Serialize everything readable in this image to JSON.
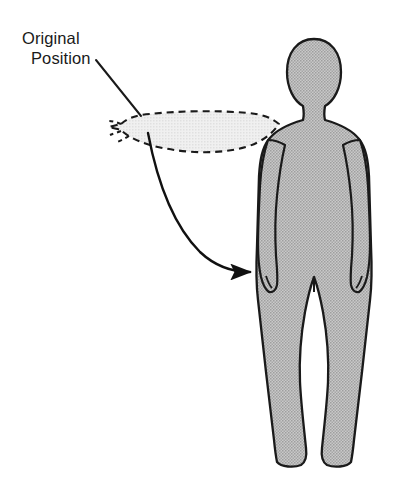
{
  "diagram": {
    "background_color": "#ffffff",
    "annotation": {
      "line1": "Original",
      "line2": "Position",
      "text_color": "#1a1a1a",
      "leader_line": {
        "from_x": 96,
        "from_y": 60,
        "to_x": 141,
        "to_y": 116
      }
    },
    "body_figure": {
      "name": "human-silhouette",
      "fill_color": "#b9b9b9",
      "outline_color": "#1a1a1a",
      "outline_width": 2.2,
      "pose": "standing, arms at sides",
      "head_center_x": 314,
      "head_center_y": 72,
      "feet_baseline_y": 466
    },
    "ghost_arm": {
      "name": "original-position-arm",
      "style": "dashed",
      "dash_pattern": "7 5",
      "stroke_color": "#1a1a1a",
      "fill_color": "#ebebeb",
      "description": "arm extended horizontally to the left at shoulder height"
    },
    "motion_arrow": {
      "name": "arm-motion-arrow",
      "stroke_color": "#111111",
      "stroke_width": 2.4,
      "direction": "downward sweeping curve to the right",
      "arrowhead_x": 255,
      "arrowhead_y": 272
    }
  }
}
